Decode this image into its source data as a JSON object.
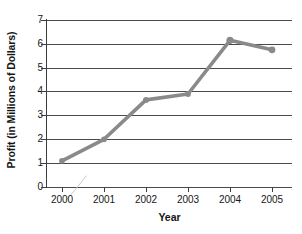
{
  "chart_data": {
    "type": "line",
    "title": "",
    "xlabel": "Year",
    "ylabel": "Profit (in Millions of Dollars)",
    "categories": [
      "2000",
      "2001",
      "2002",
      "2003",
      "2004",
      "2005"
    ],
    "values": [
      1.1,
      2.0,
      3.65,
      3.9,
      6.15,
      5.75
    ],
    "series": [
      {
        "name": "Profit",
        "values": [
          1.1,
          2.0,
          3.65,
          3.9,
          6.15,
          5.75
        ]
      }
    ],
    "ylim": [
      0,
      7
    ],
    "y_ticks": [
      "0",
      "1",
      "2",
      "3",
      "4",
      "5",
      "6",
      "7"
    ],
    "x_ticks": [
      "2000",
      "2001",
      "2002",
      "2003",
      "2004",
      "2005"
    ],
    "grid": "horizontal",
    "legend": "none",
    "line_color": "#8a8a8a",
    "marker_color": "#8a8a8a",
    "axis_color": "#3d3d3d",
    "gridline_color": "#4a4a4a",
    "background_color": "#ffffff"
  }
}
